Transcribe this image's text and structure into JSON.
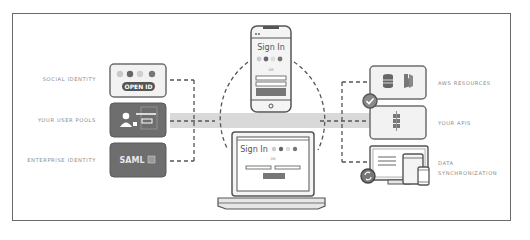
{
  "diagram": {
    "left_sources": [
      {
        "label": "SOCIAL IDENTITY",
        "badge": "OPEN ID",
        "icons": [
          "amazon-icon",
          "facebook-icon",
          "twitter-icon",
          "google-icon"
        ]
      },
      {
        "label": "YOUR USER POOLS",
        "icons": [
          "user-icon",
          "lock-icon",
          "form-icon"
        ]
      },
      {
        "label": "ENTERPRISE IDENTITY",
        "badge": "SAML",
        "icons": [
          "directory-icon"
        ]
      }
    ],
    "center_clients": {
      "phone": {
        "title": "Sign In",
        "or_text": "OR"
      },
      "laptop": {
        "title": "Sign In",
        "or_text": "OR"
      }
    },
    "right_targets": [
      {
        "label": "AWS RESOURCES",
        "icons": [
          "database-icon",
          "lambda-icon"
        ]
      },
      {
        "label": "YOUR APIS",
        "icons": [
          "api-gateway-icon"
        ]
      },
      {
        "label_line1": "DATA",
        "label_line2": "SYNCHRONIZATION",
        "icons": [
          "desktop-icon",
          "tablet-icon",
          "phone-icon",
          "sync-icon"
        ]
      }
    ],
    "colors": {
      "frame": "#6a6a6a",
      "box_dark": "#6e6e6e",
      "box_light": "#f2f2f2",
      "band": "#d9d9d9",
      "label_text": "#8a8a8a"
    }
  }
}
